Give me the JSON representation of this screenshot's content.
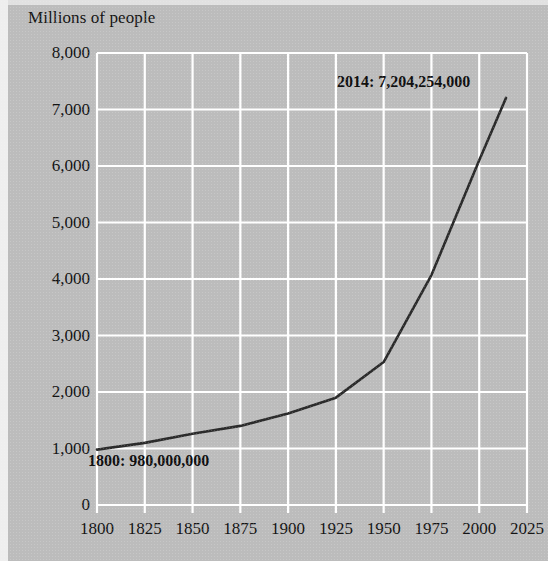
{
  "chart_data": {
    "type": "line",
    "title": "Millions of people",
    "xlabel": "",
    "ylabel": "Millions of people",
    "xlim": [
      1800,
      2025
    ],
    "ylim": [
      0,
      8000
    ],
    "grid": true,
    "legend": "none",
    "x_ticks": [
      "1800",
      "1825",
      "1850",
      "1875",
      "1900",
      "1925",
      "1950",
      "1975",
      "2000",
      "2025"
    ],
    "y_ticks": [
      "0",
      "1,000",
      "2,000",
      "3,000",
      "4,000",
      "5,000",
      "6,000",
      "7,000",
      "8,000"
    ],
    "x": [
      1800,
      1825,
      1850,
      1875,
      1900,
      1925,
      1950,
      1975,
      2000,
      2014
    ],
    "values": [
      980,
      1100,
      1260,
      1400,
      1620,
      1900,
      2530,
      4070,
      6100,
      7204
    ],
    "series": [
      {
        "name": "World population",
        "values": [
          980,
          1100,
          1260,
          1400,
          1620,
          1900,
          2530,
          4070,
          6100,
          7204
        ]
      }
    ],
    "annotations": [
      {
        "label": "1800: 980,000,000",
        "x": 1800,
        "y": 980
      },
      {
        "label": "2014: 7,204,254,000",
        "x": 2014,
        "y": 7204
      }
    ],
    "colors": {
      "background": "#bcbcbc",
      "gridline": "#ffffff",
      "line": "#2b2b2b",
      "text": "#141414"
    }
  },
  "axis": {
    "title": "Millions of people",
    "y_labels": [
      {
        "text": "8,000",
        "value": 8000
      },
      {
        "text": "7,000",
        "value": 7000
      },
      {
        "text": "6,000",
        "value": 6000
      },
      {
        "text": "5,000",
        "value": 5000
      },
      {
        "text": "4,000",
        "value": 4000
      },
      {
        "text": "3,000",
        "value": 3000
      },
      {
        "text": "2,000",
        "value": 2000
      },
      {
        "text": "1,000",
        "value": 1000
      },
      {
        "text": "0",
        "value": 0
      }
    ],
    "x_labels": [
      {
        "text": "1800",
        "value": 1800
      },
      {
        "text": "1825",
        "value": 1825
      },
      {
        "text": "1850",
        "value": 1850
      },
      {
        "text": "1875",
        "value": 1875
      },
      {
        "text": "1900",
        "value": 1900
      },
      {
        "text": "1925",
        "value": 1925
      },
      {
        "text": "1950",
        "value": 1950
      },
      {
        "text": "1975",
        "value": 1975
      },
      {
        "text": "2000",
        "value": 2000
      },
      {
        "text": "2025",
        "value": 2025
      }
    ]
  },
  "annotations": {
    "start": "1800: 980,000,000",
    "end": "2014: 7,204,254,000"
  }
}
